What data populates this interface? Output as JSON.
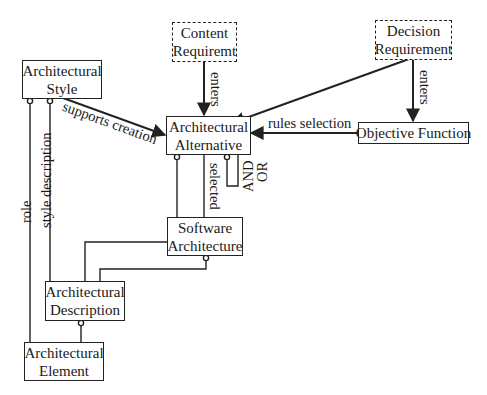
{
  "diagram": {
    "nodes": {
      "content_requirement": {
        "line1": "Content",
        "line2": "Requiremt",
        "style": "dashed"
      },
      "decision_requirement": {
        "line1": "Decision",
        "line2": "Requirement",
        "style": "dashed"
      },
      "architectural_style": {
        "line1": "Architectural",
        "line2": "Style",
        "style": "solid"
      },
      "architectural_alternative": {
        "line1": "Architectural",
        "line2": "Alternative",
        "style": "solid"
      },
      "objective_function": {
        "line1": "Objective Function",
        "style": "solid"
      },
      "software_architecture": {
        "line1": "Software",
        "line2": "Architecture",
        "style": "solid"
      },
      "architectural_description": {
        "line1": "Architectural",
        "line2": "Description",
        "style": "solid"
      },
      "architectural_element": {
        "line1": "Architectural",
        "line2": "Element",
        "style": "solid"
      }
    },
    "edge_labels": {
      "content_enters": "enters",
      "decision_enters": "enters",
      "supports_creation": "supports creation",
      "rules_selection": "rules selection",
      "selected": "selected",
      "and": "AND",
      "or": "OR",
      "role": "role",
      "style_description": "style description"
    },
    "colors": {
      "line": "#222222",
      "background": "#ffffff",
      "text": "#1a1a1a"
    }
  }
}
